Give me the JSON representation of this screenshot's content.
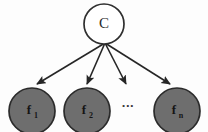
{
  "diagram": {
    "background_color": "#fdfdfd",
    "class_node": {
      "label": "C",
      "fill_color": "#ffffff",
      "stroke_color": "#2f2f2f",
      "cx": 104,
      "cy": 24,
      "r": 20
    },
    "edge_color": "#262626",
    "edge_origin": {
      "x": 105,
      "y": 43
    },
    "feature_nodes": [
      {
        "label": "f",
        "subscript": "1",
        "full_label": "f1",
        "fill_color": "#6e6e6e",
        "stroke_color": "#2b2b2b",
        "cx": 32,
        "cy": 111,
        "r": 23,
        "arrow_tip": {
          "x": 34,
          "y": 88
        }
      },
      {
        "label": "f",
        "subscript": "2",
        "full_label": "f2",
        "fill_color": "#6e6e6e",
        "stroke_color": "#2b2b2b",
        "cx": 87,
        "cy": 111,
        "r": 23,
        "arrow_tip": {
          "x": 86,
          "y": 88
        }
      },
      {
        "label": "f",
        "subscript": "n",
        "full_label": "fn",
        "fill_color": "#6e6e6e",
        "stroke_color": "#2b2b2b",
        "cx": 177,
        "cy": 111,
        "r": 23,
        "arrow_tip": {
          "x": 172,
          "y": 88
        }
      }
    ],
    "ellipsis": {
      "text": "...",
      "x": 128,
      "y": 104,
      "arrow_tip": {
        "x": 128,
        "y": 88
      }
    }
  }
}
